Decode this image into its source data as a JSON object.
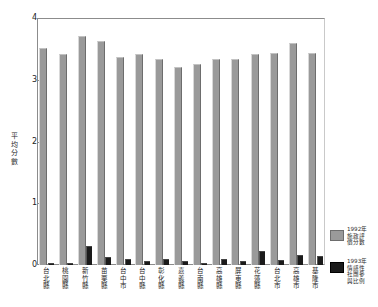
{
  "chart_data": {
    "type": "bar",
    "title": "",
    "xlabel": "",
    "ylabel": "平均分數",
    "ylim": [
      0,
      4
    ],
    "yticks": [
      "0",
      "1",
      "2",
      "3",
      "4"
    ],
    "grid": false,
    "legend_position": "right",
    "categories": [
      "台北縣",
      "桃園縣",
      "新竹縣",
      "苗栗縣",
      "台中市",
      "台中縣",
      "彰化縣",
      "嘉義縣",
      "台南縣",
      "高雄縣",
      "屏東縣",
      "花蓮縣",
      "台北市",
      "高雄市",
      "基隆市"
    ],
    "series": [
      {
        "name": "1992年施政評價分數",
        "color": "#9a9a9a",
        "values": [
          3.52,
          3.41,
          3.71,
          3.62,
          3.37,
          3.41,
          3.33,
          3.2,
          3.26,
          3.34,
          3.33,
          3.41,
          3.44,
          3.6,
          3.44
        ]
      },
      {
        "name": "1993年情感性社團參與比例",
        "color": "#1b1b1b",
        "values": [
          0.04,
          0.03,
          0.3,
          0.13,
          0.09,
          0.06,
          0.1,
          0.06,
          0.03,
          0.1,
          0.06,
          0.22,
          0.08,
          0.17,
          0.14
        ]
      }
    ]
  },
  "axis": {
    "y_title_chars": [
      "平",
      "均",
      "分",
      "數"
    ]
  },
  "legend": {
    "items": [
      {
        "key": "series-1992",
        "lines": [
          "1992年",
          "施政評",
          "價分數"
        ],
        "color": "#9a9a9a"
      },
      {
        "key": "series-1993",
        "lines": [
          "1993年",
          "情感性",
          "社團參",
          "與比例"
        ],
        "color": "#1b1b1b"
      }
    ]
  }
}
